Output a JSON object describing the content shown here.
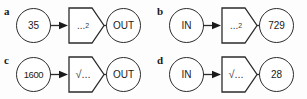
{
  "figure": {
    "type": "function-machine-diagram",
    "background_color": "#fdfdfd",
    "stroke_color": "#2b2b2b",
    "text_color": "#1a1a1a"
  },
  "panels": [
    {
      "label": "a",
      "input": "35",
      "operator_text": "...",
      "operator_exponent": "2",
      "operator_kind": "square",
      "output": "OUT"
    },
    {
      "label": "b",
      "input": "IN",
      "operator_text": "...",
      "operator_exponent": "2",
      "operator_kind": "square",
      "output": "729"
    },
    {
      "label": "c",
      "input": "1600",
      "operator_text": "√...",
      "operator_exponent": "",
      "operator_kind": "square-root",
      "output": "OUT"
    },
    {
      "label": "d",
      "input": "IN",
      "operator_text": "√...",
      "operator_exponent": "",
      "operator_kind": "square-root",
      "output": "28"
    }
  ]
}
